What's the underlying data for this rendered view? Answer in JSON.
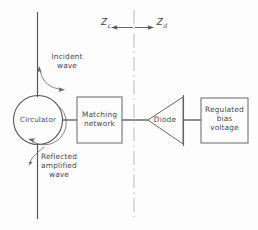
{
  "diagram": {
    "background_color": "#fdfdfd",
    "line_color": "#4a4a4a",
    "impedance_labels": {
      "left": {
        "symbol": "Z",
        "subscript": "c",
        "direction": "left"
      },
      "right": {
        "symbol": "Z",
        "subscript": "d",
        "direction": "right"
      }
    },
    "annotations": {
      "incident": "Incident\nwave",
      "reflected": "Reflected\namplified\nwave"
    },
    "blocks": [
      {
        "id": "circulator",
        "label": "Circulator",
        "shape": "circle"
      },
      {
        "id": "matching-network",
        "label": "Matching\nnetwork",
        "shape": "rectangle"
      },
      {
        "id": "diode",
        "label": "Diode",
        "shape": "triangle"
      },
      {
        "id": "bias",
        "label": "Regulated\nbias\nvoltage",
        "shape": "rectangle"
      }
    ]
  }
}
